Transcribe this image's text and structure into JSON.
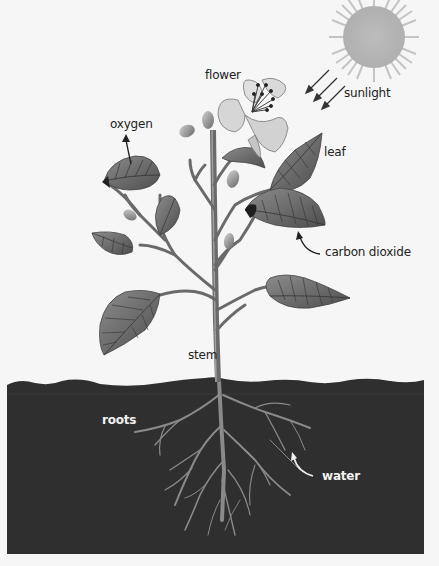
{
  "diagram": {
    "labels": {
      "flower": "flower",
      "sunlight": "sunlight",
      "oxygen": "oxygen",
      "leaf": "leaf",
      "carbon_dioxide": "carbon dioxide",
      "stem": "stem",
      "roots": "roots",
      "water": "water"
    },
    "colors": {
      "background": "#f6f6f6",
      "sun": "#b8b8b8",
      "soil": "#2e2e2e",
      "leaf_dark": "#5a5a5a",
      "leaf_light": "#9a9a9a",
      "stem": "#6e6e6e",
      "petal": "#d8d8d8",
      "root": "#8a8a8a",
      "text": "#222222",
      "text_on_soil": "#f2f2f2"
    }
  }
}
